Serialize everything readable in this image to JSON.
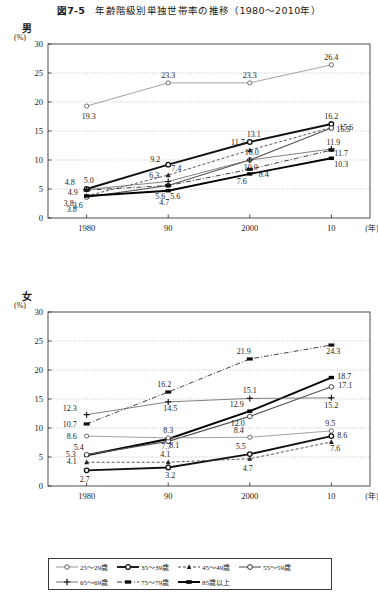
{
  "figure": {
    "number": "図7-5",
    "title": "年齢階級別単独世帯率の推移（1980～2010年）"
  },
  "panels": [
    {
      "key": "male",
      "sex_label": "男",
      "unit": "(%)"
    },
    {
      "key": "female",
      "sex_label": "女",
      "unit": "(%)"
    }
  ],
  "axis": {
    "y_ticks": [
      "0",
      "5",
      "10",
      "15",
      "20",
      "25",
      "30"
    ],
    "x_ticks": [
      "1980",
      "90",
      "2000",
      "10"
    ],
    "x_unit": "(年)"
  },
  "legend": {
    "items": [
      {
        "label": "25～29歳",
        "marker": "open-circle",
        "line": "solid-thin",
        "color": "#8a8a8a"
      },
      {
        "label": "35～39歳",
        "marker": "filled-square",
        "line": "solid-thick",
        "color": "#111111"
      },
      {
        "label": "45～49歳",
        "marker": "filled-triangle",
        "line": "dashed",
        "color": "#333333"
      },
      {
        "label": "55～59歳",
        "marker": "open-circle",
        "line": "solid-mid",
        "color": "#555555"
      },
      {
        "label": "65～69歳",
        "marker": "plus",
        "line": "solid-thin",
        "color": "#666666"
      },
      {
        "label": "75～79歳",
        "marker": "filled-rect",
        "line": "dash-dot",
        "color": "#222222"
      },
      {
        "label": "85歳以上",
        "marker": "filled-square",
        "line": "solid-thick",
        "color": "#000000"
      }
    ]
  },
  "chart_data": [
    {
      "type": "line",
      "title": "男",
      "xlabel": "(年)",
      "ylabel": "(%)",
      "ylim": [
        0,
        30
      ],
      "grid": true,
      "legend_position": "bottom",
      "categories": [
        "1980",
        "90",
        "2000",
        "10"
      ],
      "series": [
        {
          "name": "25～29歳",
          "values": [
            19.3,
            23.3,
            23.3,
            26.4
          ]
        },
        {
          "name": "35～39歳",
          "values": [
            5.0,
            9.2,
            13.1,
            16.2
          ]
        },
        {
          "name": "45～49歳",
          "values": [
            3.8,
            7.4,
            11.7,
            15.6
          ]
        },
        {
          "name": "55～59歳",
          "values": [
            3.6,
            5.6,
            10.0,
            15.5
          ]
        },
        {
          "name": "65～69歳",
          "values": [
            4.9,
            6.3,
            10.0,
            11.9
          ]
        },
        {
          "name": "75～79歳",
          "values": [
            4.8,
            5.6,
            8.4,
            11.7
          ]
        },
        {
          "name": "85歳以上",
          "values": [
            3.8,
            4.7,
            7.6,
            10.3
          ]
        }
      ],
      "point_labels_1980": [
        "4.8",
        "5.0",
        "4.9",
        "3.8",
        "3.6",
        "3.8",
        "19.3"
      ],
      "point_labels_1990": [
        "9.2",
        "7.4",
        "6.3",
        "5.6",
        "4.7",
        "5.6",
        "23.3"
      ],
      "point_labels_2000": [
        "13.1",
        "11.7",
        "10.0",
        "10.0",
        "8.4",
        "7.6",
        "23.3"
      ],
      "point_labels_2010": [
        "16.2",
        "15.6",
        "15.5",
        "11.9",
        "11.7",
        "10.3",
        "26.4"
      ]
    },
    {
      "type": "line",
      "title": "女",
      "xlabel": "(年)",
      "ylabel": "(%)",
      "ylim": [
        0,
        30
      ],
      "grid": true,
      "legend_position": "bottom",
      "categories": [
        "1980",
        "90",
        "2000",
        "10"
      ],
      "series": [
        {
          "name": "75～79歳",
          "values": [
            10.7,
            16.2,
            21.9,
            24.3
          ]
        },
        {
          "name": "85歳以上",
          "values": [
            5.3,
            8.1,
            12.9,
            18.7
          ]
        },
        {
          "name": "55～59歳",
          "values": [
            5.4,
            7.7,
            12.0,
            17.1
          ]
        },
        {
          "name": "65～69歳",
          "values": [
            12.3,
            14.5,
            15.1,
            15.2
          ]
        },
        {
          "name": "25～29歳",
          "values": [
            8.6,
            8.3,
            8.4,
            9.5
          ]
        },
        {
          "name": "35～39歳",
          "values": [
            2.7,
            3.2,
            5.5,
            8.6
          ]
        },
        {
          "name": "45～49歳",
          "values": [
            4.1,
            4.1,
            4.7,
            7.6
          ]
        }
      ],
      "point_labels_1980": [
        "12.3",
        "10.7",
        "8.6",
        "5.4",
        "5.3",
        "4.1",
        "2.7"
      ],
      "point_labels_1990": [
        "16.2",
        "14.5",
        "8.3",
        "8.1",
        "7.7",
        "4.1",
        "3.2"
      ],
      "point_labels_2000": [
        "21.9",
        "15.1",
        "12.9",
        "12.0",
        "8.4",
        "5.5",
        "4.7"
      ],
      "point_labels_2010": [
        "24.3",
        "18.7",
        "17.1",
        "15.2",
        "9.5",
        "8.6",
        "7.6"
      ]
    }
  ]
}
